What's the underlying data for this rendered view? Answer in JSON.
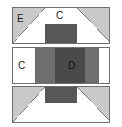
{
  "figure": {
    "background_color": "#ffffff",
    "outline_color": "#6f6f6f",
    "panel_count": 3
  },
  "palette": {
    "light_gray": "#c9c9c9",
    "medium_gray": "#6e6e6e",
    "dark_gray": "#575757",
    "deep_gray": "#4a4a4a",
    "white": "#ffffff",
    "outline": "#6f6f6f",
    "text": "#1a1a1a"
  },
  "panels": [
    {
      "id": "top",
      "name": "panel-top",
      "cells": [
        {
          "id": "top-left",
          "shape": "diagonal-split-square",
          "diagonal": "top-left-to-bottom-right",
          "upper_fill": "#c9c9c9",
          "lower_fill": "#ffffff",
          "label": "E"
        },
        {
          "id": "top-center",
          "shape": "horizontal-split",
          "upper_fill": "#ffffff",
          "lower_fill": "#575757",
          "label": "C"
        },
        {
          "id": "top-right",
          "shape": "diagonal-split-square",
          "diagonal": "top-right-to-bottom-left",
          "upper_fill": "#c9c9c9",
          "lower_fill": "#ffffff",
          "label": ""
        }
      ]
    },
    {
      "id": "middle",
      "name": "panel-middle",
      "cells": [
        {
          "id": "mid-left",
          "shape": "solid-bar",
          "fill": "#ffffff",
          "label": "C"
        },
        {
          "id": "mid-inner-left",
          "shape": "solid-bar",
          "fill": "#6e6e6e",
          "label": ""
        },
        {
          "id": "mid-center",
          "shape": "solid-bar",
          "fill": "#4a4a4a",
          "label": "D"
        },
        {
          "id": "mid-inner-right",
          "shape": "solid-bar",
          "fill": "#6e6e6e",
          "label": ""
        },
        {
          "id": "mid-right",
          "shape": "solid-bar",
          "fill": "#ffffff",
          "label": ""
        }
      ]
    },
    {
      "id": "bottom",
      "name": "panel-bottom",
      "cells": [
        {
          "id": "bottom-left",
          "shape": "diagonal-split-square",
          "diagonal": "top-left-to-bottom-right",
          "upper_fill": "#c9c9c9",
          "lower_fill": "#ffffff",
          "label": ""
        },
        {
          "id": "bottom-center",
          "shape": "horizontal-split",
          "upper_fill": "#575757",
          "lower_fill": "#ffffff",
          "label": ""
        },
        {
          "id": "bottom-right",
          "shape": "diagonal-split-square",
          "diagonal": "top-right-to-bottom-left",
          "upper_fill": "#c9c9c9",
          "lower_fill": "#ffffff",
          "label": ""
        }
      ]
    }
  ]
}
